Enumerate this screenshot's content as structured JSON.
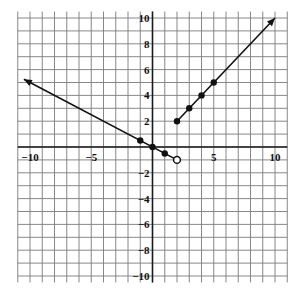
{
  "chart_data": {
    "type": "line",
    "title": "",
    "xlabel": "",
    "ylabel": "",
    "xlim": [
      -11,
      11
    ],
    "ylim": [
      -10.5,
      10.5
    ],
    "grid": true,
    "x_ticks": [
      -10,
      -5,
      5,
      10
    ],
    "y_ticks": [
      10,
      8,
      6,
      4,
      2,
      -2,
      -4,
      -6,
      -8,
      -10
    ],
    "x_tick_labels": [
      "−10",
      "−5",
      "5",
      "10"
    ],
    "y_tick_labels": [
      "10",
      "8",
      "6",
      "4",
      "2",
      "−2",
      "−4",
      "−6",
      "−8",
      "−10"
    ],
    "series": [
      {
        "name": "left-branch",
        "equation": "y = -0.5x",
        "domain": "x < 2",
        "line_from": [
          -10.5,
          5.25
        ],
        "line_to": [
          2,
          -1
        ],
        "arrow_at_start": true,
        "filled_points": [
          [
            -1,
            0.5
          ],
          [
            0,
            0
          ],
          [
            1,
            -0.5
          ]
        ],
        "open_points": [
          [
            2,
            -1
          ]
        ]
      },
      {
        "name": "right-branch",
        "equation": "y = x",
        "domain": "x >= 2",
        "line_from": [
          2,
          2
        ],
        "line_to": [
          10,
          10
        ],
        "arrow_at_end": true,
        "filled_points": [
          [
            2,
            2
          ],
          [
            3,
            3
          ],
          [
            4,
            4
          ],
          [
            5,
            5
          ]
        ],
        "open_points": []
      }
    ]
  }
}
